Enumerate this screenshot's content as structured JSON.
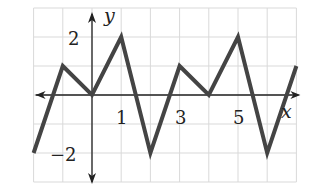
{
  "chart_data": {
    "type": "line",
    "title": "",
    "xlabel": "x",
    "ylabel": "y",
    "x": [
      -2,
      -1,
      0,
      1,
      2,
      3,
      4,
      5,
      6,
      7
    ],
    "series": [
      {
        "name": "f(x)",
        "values": [
          -2,
          1,
          0,
          2,
          -2,
          1,
          0,
          2,
          -2,
          1
        ]
      }
    ],
    "xlim": [
      -2,
      7
    ],
    "ylim": [
      -3,
      3
    ],
    "grid": true,
    "x_tick_labels": [
      "1",
      "3",
      "5"
    ],
    "y_tick_labels": [
      "2",
      "−2"
    ],
    "legend": "none"
  },
  "labels": {
    "x_axis": "x",
    "y_axis": "y",
    "tick_x1": "1",
    "tick_x3": "3",
    "tick_x5": "5",
    "tick_y2": "2",
    "tick_yneg2": "−2"
  },
  "colors": {
    "grid": "#d9d9d9",
    "axis": "#222222",
    "curve": "#444444"
  }
}
